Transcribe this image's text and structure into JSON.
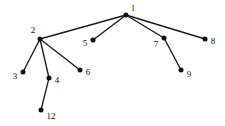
{
  "figure": {
    "background_color": "#ffffff",
    "node_color": "#111111",
    "edge_color": "#1a1a1a",
    "width": 225,
    "height": 126
  },
  "chart_data": {
    "type": "diagram",
    "subtype": "node-link-graph",
    "title": "",
    "directed": false,
    "layout": "fixed-coordinates",
    "node_labels": [
      "1",
      "2",
      "3",
      "4",
      "5",
      "6",
      "7",
      "8",
      "9",
      "12"
    ],
    "nodes": [
      {
        "id": "1",
        "label": "1",
        "x": 126,
        "y": 15,
        "label_x": 133,
        "label_y": 9,
        "label_anchor": "middle"
      },
      {
        "id": "2",
        "label": "2",
        "x": 40,
        "y": 39,
        "label_x": 33,
        "label_y": 31,
        "label_anchor": "middle"
      },
      {
        "id": "3",
        "label": "3",
        "x": 23,
        "y": 72,
        "label_x": 15,
        "label_y": 77,
        "label_anchor": "middle"
      },
      {
        "id": "4",
        "label": "4",
        "x": 49,
        "y": 78,
        "label_x": 57,
        "label_y": 81,
        "label_anchor": "middle"
      },
      {
        "id": "5",
        "label": "5",
        "x": 93,
        "y": 40,
        "label_x": 85,
        "label_y": 44,
        "label_anchor": "middle"
      },
      {
        "id": "6",
        "label": "6",
        "x": 80,
        "y": 70,
        "label_x": 88,
        "label_y": 73,
        "label_anchor": "middle"
      },
      {
        "id": "7",
        "label": "7",
        "x": 164,
        "y": 38,
        "label_x": 156,
        "label_y": 45,
        "label_anchor": "middle"
      },
      {
        "id": "8",
        "label": "8",
        "x": 205,
        "y": 39,
        "label_x": 213,
        "label_y": 42,
        "label_anchor": "middle"
      },
      {
        "id": "9",
        "label": "9",
        "x": 181,
        "y": 70,
        "label_x": 189,
        "label_y": 75,
        "label_anchor": "middle"
      },
      {
        "id": "12",
        "label": "12",
        "x": 41,
        "y": 110,
        "label_x": 51,
        "label_y": 117,
        "label_anchor": "middle"
      }
    ],
    "edges": [
      {
        "source": "1",
        "target": "2"
      },
      {
        "source": "1",
        "target": "5"
      },
      {
        "source": "1",
        "target": "7"
      },
      {
        "source": "1",
        "target": "8"
      },
      {
        "source": "2",
        "target": "3"
      },
      {
        "source": "2",
        "target": "4"
      },
      {
        "source": "2",
        "target": "6"
      },
      {
        "source": "4",
        "target": "12"
      },
      {
        "source": "7",
        "target": "9"
      }
    ],
    "edge_count": 9,
    "node_count": 10
  }
}
